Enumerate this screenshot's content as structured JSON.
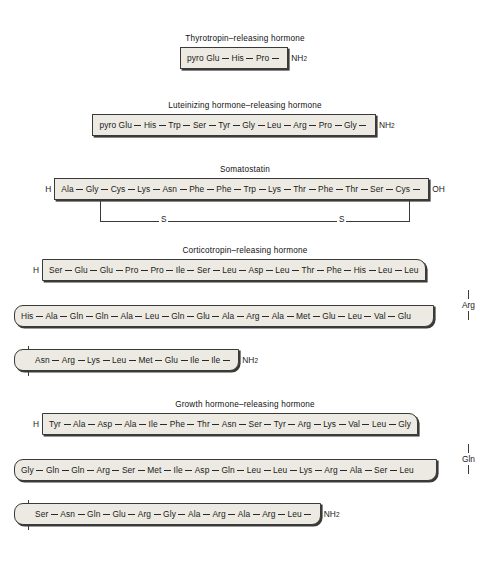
{
  "figure": {
    "dash": "—",
    "amide": "NH",
    "amide_sub": "2",
    "n_terminus": "H",
    "c_terminus": "OH",
    "sulfur_label": "S"
  },
  "hormones": [
    {
      "name": "trh",
      "title": "Thyrotropin–releasing hormone",
      "n_cap": "",
      "c_cap": "NH2",
      "rows": [
        {
          "residues": [
            "pyro Glu",
            "His",
            "Pro"
          ]
        }
      ]
    },
    {
      "name": "lhrh",
      "title": "Luteinizing hormone–releasing hormone",
      "n_cap": "",
      "c_cap": "NH2",
      "rows": [
        {
          "residues": [
            "pyro Glu",
            "His",
            "Trp",
            "Ser",
            "Tyr",
            "Gly",
            "Leu",
            "Arg",
            "Pro",
            "Gly"
          ]
        }
      ]
    },
    {
      "name": "somatostatin",
      "title": "Somatostatin",
      "n_cap": "H",
      "c_cap": "OH",
      "disulfide": {
        "from_residue": "Cys",
        "to_residue": "Cys",
        "label": "S"
      },
      "rows": [
        {
          "residues": [
            "Ala",
            "Gly",
            "Cys",
            "Lys",
            "Asn",
            "Phe",
            "Phe",
            "Trp",
            "Lys",
            "Thr",
            "Phe",
            "Thr",
            "Ser",
            "Cys"
          ]
        }
      ]
    },
    {
      "name": "crh",
      "title": "Corticotropin–releasing hormone",
      "n_cap": "H",
      "c_cap": "NH2",
      "rows": [
        {
          "residues": [
            "Ser",
            "Glu",
            "Glu",
            "Pro",
            "Pro",
            "Ile",
            "Ser",
            "Leu",
            "Asp",
            "Leu",
            "Thr",
            "Phe",
            "His",
            "Leu",
            "Leu"
          ],
          "wrap_residue": "Arg",
          "wrap_side": "right"
        },
        {
          "residues": [
            "His",
            "Ala",
            "Gln",
            "Gln",
            "Ala",
            "Leu",
            "Gln",
            "Glu",
            "Ala",
            "Arg",
            "Ala",
            "Met",
            "Glu",
            "Leu",
            "Val",
            "Glu"
          ],
          "wrap_residue": "Ser",
          "wrap_side": "left"
        },
        {
          "residues": [
            "Asn",
            "Arg",
            "Lys",
            "Leu",
            "Met",
            "Glu",
            "Ile",
            "Ile"
          ]
        }
      ]
    },
    {
      "name": "ghrh",
      "title": "Growth hormone–releasing hormone",
      "n_cap": "H",
      "c_cap": "NH2",
      "rows": [
        {
          "residues": [
            "Tyr",
            "Ala",
            "Asp",
            "Ala",
            "Ile",
            "Phe",
            "Thr",
            "Asn",
            "Ser",
            "Tyr",
            "Arg",
            "Lys",
            "Val",
            "Leu",
            "Gly"
          ],
          "wrap_residue": "Gln",
          "wrap_side": "right"
        },
        {
          "residues": [
            "Gly",
            "Gln",
            "Gln",
            "Arg",
            "Ser",
            "Met",
            "Ile",
            "Asp",
            "Gln",
            "Leu",
            "Leu",
            "Lys",
            "Arg",
            "Ala",
            "Ser",
            "Leu"
          ],
          "wrap_residue": "Glu",
          "wrap_side": "left"
        },
        {
          "residues": [
            "Ser",
            "Asn",
            "Gln",
            "Glu",
            "Arg",
            "Gly",
            "Ala",
            "Arg",
            "Ala",
            "Arg",
            "Leu"
          ]
        }
      ]
    }
  ],
  "colors": {
    "box_fill": "#eceae2",
    "box_border": "#3a3a38",
    "page_background": "#ffffff",
    "text": "#1a1a1a"
  }
}
